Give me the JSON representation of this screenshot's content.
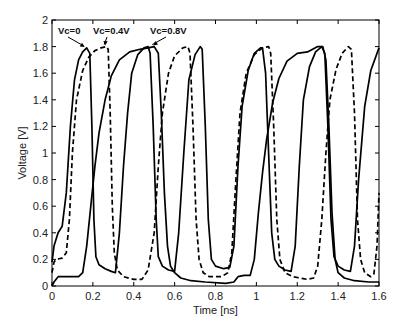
{
  "chart_data": {
    "type": "line",
    "title": "",
    "xlabel": "Time [ns]",
    "ylabel": "Voltage [V]",
    "xlim": [
      0,
      1.6
    ],
    "ylim": [
      0,
      2
    ],
    "grid": false,
    "legend": "none",
    "xticks": [
      0,
      0.2,
      0.4,
      0.6,
      0.8,
      1,
      1.2,
      1.4,
      1.6
    ],
    "xtick_labels": [
      "0",
      "0.2",
      "0.4",
      "0.6",
      "0.8",
      "1",
      "1.2",
      "1.4",
      "1.6"
    ],
    "yticks": [
      0,
      0.2,
      0.4,
      0.6,
      0.8,
      1,
      1.2,
      1.4,
      1.6,
      1.8,
      2
    ],
    "ytick_labels": [
      "0",
      "0.2",
      "0.4",
      "0.6",
      "0.8",
      "1",
      "1.2",
      "1.4",
      "1.6",
      "1.8",
      "2"
    ],
    "series": [
      {
        "name": "Vc=0",
        "style": "solid",
        "color": "#000000",
        "points": [
          [
            0,
            0.18
          ],
          [
            0.01,
            0.3
          ],
          [
            0.03,
            0.4
          ],
          [
            0.05,
            0.45
          ],
          [
            0.07,
            0.7
          ],
          [
            0.09,
            1.2
          ],
          [
            0.11,
            1.55
          ],
          [
            0.13,
            1.7
          ],
          [
            0.15,
            1.76
          ],
          [
            0.17,
            1.79
          ],
          [
            0.185,
            1.75
          ],
          [
            0.195,
            1.2
          ],
          [
            0.205,
            0.5
          ],
          [
            0.215,
            0.22
          ],
          [
            0.23,
            0.16
          ],
          [
            0.26,
            0.13
          ],
          [
            0.29,
            0.11
          ],
          [
            0.31,
            0.1
          ],
          [
            0.33,
            0.4
          ],
          [
            0.35,
            0.9
          ],
          [
            0.37,
            1.3
          ],
          [
            0.39,
            1.6
          ],
          [
            0.42,
            1.74
          ],
          [
            0.45,
            1.79
          ],
          [
            0.47,
            1.8
          ],
          [
            0.48,
            1.75
          ],
          [
            0.495,
            1.2
          ],
          [
            0.51,
            0.5
          ],
          [
            0.52,
            0.22
          ],
          [
            0.54,
            0.15
          ],
          [
            0.57,
            0.12
          ],
          [
            0.6,
            0.11
          ],
          [
            0.62,
            0.4
          ],
          [
            0.645,
            1.0
          ],
          [
            0.67,
            1.55
          ],
          [
            0.7,
            1.74
          ],
          [
            0.725,
            1.8
          ],
          [
            0.735,
            1.78
          ],
          [
            0.75,
            1.2
          ],
          [
            0.765,
            0.5
          ],
          [
            0.78,
            0.2
          ],
          [
            0.8,
            0.15
          ],
          [
            0.84,
            0.13
          ],
          [
            0.87,
            0.14
          ],
          [
            0.89,
            0.3
          ],
          [
            0.91,
            0.9
          ],
          [
            0.93,
            1.35
          ],
          [
            0.96,
            1.62
          ],
          [
            0.99,
            1.75
          ],
          [
            1.02,
            1.79
          ],
          [
            1.03,
            1.79
          ],
          [
            1.045,
            1.6
          ],
          [
            1.06,
            1.0
          ],
          [
            1.075,
            0.4
          ],
          [
            1.09,
            0.2
          ],
          [
            1.11,
            0.15
          ],
          [
            1.14,
            0.12
          ],
          [
            1.17,
            0.11
          ],
          [
            1.19,
            0.3
          ],
          [
            1.21,
            0.9
          ],
          [
            1.23,
            1.4
          ],
          [
            1.26,
            1.65
          ],
          [
            1.29,
            1.76
          ],
          [
            1.32,
            1.8
          ],
          [
            1.335,
            1.75
          ],
          [
            1.35,
            1.2
          ],
          [
            1.365,
            0.5
          ],
          [
            1.38,
            0.22
          ],
          [
            1.4,
            0.15
          ],
          [
            1.43,
            0.12
          ],
          [
            1.46,
            0.11
          ],
          [
            1.48,
            0.3
          ],
          [
            1.5,
            0.8
          ],
          [
            1.53,
            1.35
          ],
          [
            1.56,
            1.62
          ],
          [
            1.6,
            1.79
          ]
        ]
      },
      {
        "name": "Vc=0.4V",
        "style": "dashed",
        "color": "#000000",
        "points": [
          [
            0,
            0.1
          ],
          [
            0.01,
            0.18
          ],
          [
            0.02,
            0.2
          ],
          [
            0.05,
            0.21
          ],
          [
            0.07,
            0.25
          ],
          [
            0.085,
            0.5
          ],
          [
            0.1,
            1.0
          ],
          [
            0.12,
            1.4
          ],
          [
            0.15,
            1.62
          ],
          [
            0.18,
            1.72
          ],
          [
            0.21,
            1.77
          ],
          [
            0.24,
            1.79
          ],
          [
            0.265,
            1.8
          ],
          [
            0.275,
            1.78
          ],
          [
            0.285,
            1.3
          ],
          [
            0.295,
            0.6
          ],
          [
            0.305,
            0.25
          ],
          [
            0.32,
            0.12
          ],
          [
            0.35,
            0.07
          ],
          [
            0.4,
            0.05
          ],
          [
            0.44,
            0.05
          ],
          [
            0.47,
            0.12
          ],
          [
            0.5,
            0.4
          ],
          [
            0.52,
            0.9
          ],
          [
            0.54,
            1.3
          ],
          [
            0.57,
            1.6
          ],
          [
            0.6,
            1.73
          ],
          [
            0.64,
            1.79
          ],
          [
            0.665,
            1.8
          ],
          [
            0.675,
            1.75
          ],
          [
            0.69,
            1.2
          ],
          [
            0.705,
            0.5
          ],
          [
            0.72,
            0.2
          ],
          [
            0.74,
            0.1
          ],
          [
            0.77,
            0.07
          ],
          [
            0.83,
            0.07
          ],
          [
            0.86,
            0.1
          ],
          [
            0.88,
            0.25
          ],
          [
            0.9,
            0.8
          ],
          [
            0.92,
            1.3
          ],
          [
            0.95,
            1.6
          ],
          [
            0.99,
            1.74
          ],
          [
            1.03,
            1.79
          ],
          [
            1.06,
            1.8
          ],
          [
            1.07,
            1.75
          ],
          [
            1.085,
            1.2
          ],
          [
            1.1,
            0.5
          ],
          [
            1.115,
            0.2
          ],
          [
            1.14,
            0.1
          ],
          [
            1.18,
            0.07
          ],
          [
            1.25,
            0.05
          ],
          [
            1.28,
            0.06
          ],
          [
            1.3,
            0.15
          ],
          [
            1.32,
            0.5
          ],
          [
            1.34,
            1.0
          ],
          [
            1.36,
            1.4
          ],
          [
            1.39,
            1.63
          ],
          [
            1.42,
            1.75
          ],
          [
            1.45,
            1.8
          ],
          [
            1.465,
            1.78
          ],
          [
            1.48,
            1.3
          ],
          [
            1.495,
            0.5
          ],
          [
            1.51,
            0.2
          ],
          [
            1.53,
            0.1
          ],
          [
            1.56,
            0.07
          ],
          [
            1.575,
            0.09
          ],
          [
            1.59,
            0.3
          ],
          [
            1.6,
            0.7
          ]
        ]
      },
      {
        "name": "Vc=0.8V",
        "style": "solid",
        "color": "#000000",
        "points": [
          [
            0,
            0.0
          ],
          [
            0.01,
            0.03
          ],
          [
            0.03,
            0.07
          ],
          [
            0.08,
            0.07
          ],
          [
            0.13,
            0.07
          ],
          [
            0.15,
            0.1
          ],
          [
            0.17,
            0.3
          ],
          [
            0.19,
            0.6
          ],
          [
            0.21,
            0.9
          ],
          [
            0.23,
            1.15
          ],
          [
            0.26,
            1.4
          ],
          [
            0.29,
            1.58
          ],
          [
            0.33,
            1.7
          ],
          [
            0.38,
            1.76
          ],
          [
            0.43,
            1.78
          ],
          [
            0.47,
            1.79
          ],
          [
            0.5,
            1.8
          ],
          [
            0.52,
            1.75
          ],
          [
            0.535,
            1.3
          ],
          [
            0.55,
            0.7
          ],
          [
            0.565,
            0.3
          ],
          [
            0.58,
            0.15
          ],
          [
            0.6,
            0.1
          ],
          [
            0.63,
            0.06
          ],
          [
            0.68,
            0.04
          ],
          [
            0.75,
            0.03
          ],
          [
            0.85,
            0.02
          ],
          [
            0.89,
            0.03
          ],
          [
            0.91,
            0.07
          ],
          [
            0.94,
            0.08
          ],
          [
            0.97,
            0.08
          ],
          [
            0.99,
            0.2
          ],
          [
            1.01,
            0.55
          ],
          [
            1.03,
            0.85
          ],
          [
            1.05,
            1.1
          ],
          [
            1.08,
            1.38
          ],
          [
            1.11,
            1.56
          ],
          [
            1.15,
            1.69
          ],
          [
            1.2,
            1.75
          ],
          [
            1.25,
            1.76
          ],
          [
            1.3,
            1.8
          ],
          [
            1.325,
            1.8
          ],
          [
            1.34,
            1.7
          ],
          [
            1.355,
            1.2
          ],
          [
            1.37,
            0.55
          ],
          [
            1.385,
            0.2
          ],
          [
            1.4,
            0.1
          ],
          [
            1.43,
            0.06
          ],
          [
            1.48,
            0.04
          ],
          [
            1.55,
            0.03
          ],
          [
            1.6,
            0.03
          ]
        ]
      }
    ],
    "annotations": [
      {
        "text": "Vc=0",
        "series": "Vc=0",
        "arrow_to": [
          0.165,
          1.79
        ]
      },
      {
        "text": "Vc=0.4V",
        "series": "Vc=0.4V",
        "arrow_to": [
          0.265,
          1.8
        ]
      },
      {
        "text": "Vc=0.8V",
        "series": "Vc=0.8V",
        "arrow_to": [
          0.5,
          1.8
        ]
      }
    ]
  }
}
